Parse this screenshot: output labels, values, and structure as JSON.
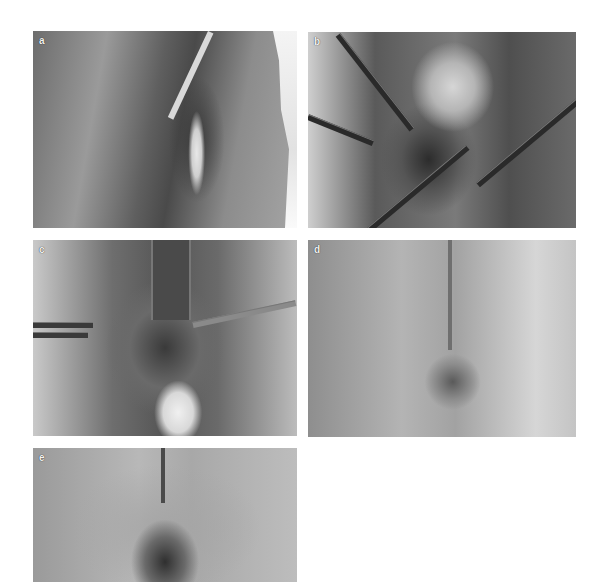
{
  "figure": {
    "type": "multi-panel clinical photograph figure",
    "color_mode": "grayscale",
    "panels": [
      {
        "label": "a",
        "description": "Preoperative view of perineal region with catheter in place"
      },
      {
        "label": "b",
        "description": "Intraoperative view with retractors and dissected tissue"
      },
      {
        "label": "c",
        "description": "Intraoperative view with retractor, forceps and gloved finger"
      },
      {
        "label": "d",
        "description": "Postoperative view with sutured repair"
      },
      {
        "label": "e",
        "description": "Follow-up view of healed region"
      }
    ]
  }
}
